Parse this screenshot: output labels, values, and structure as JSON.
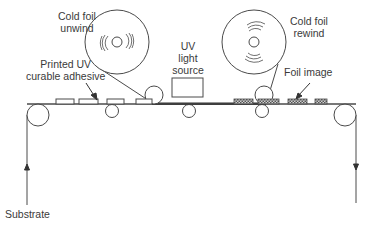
{
  "diagram": {
    "labels": {
      "unwind_line1": "Cold foil",
      "unwind_line2": "unwind",
      "rewind_line1": "Cold foil",
      "rewind_line2": "rewind",
      "uv_line1": "UV",
      "uv_line2": "light",
      "uv_line3": "source",
      "adhesive_line1": "Printed UV",
      "adhesive_line2": "curable adhesive",
      "foil_image": "Foil image",
      "substrate": "Substrate"
    },
    "colors": {
      "line": "#4a4a4a",
      "text": "#3a3a3a",
      "foil_fill": "#8a8a8a",
      "background": "#ffffff"
    },
    "components": [
      "Cold foil unwind reel",
      "Cold foil rewind reel",
      "UV light source",
      "Nip rollers",
      "Idler rollers",
      "Printed UV curable adhesive pads",
      "Foil image pads",
      "Substrate web"
    ],
    "flow": "Substrate enters from bottom left (arrow up), travels right, exits bottom right (arrow down)"
  }
}
